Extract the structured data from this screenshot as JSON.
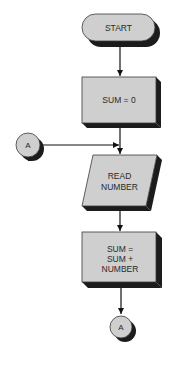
{
  "diagram": {
    "type": "flowchart",
    "colors": {
      "fill": "#cfcfcf",
      "shadow": "#1c1c1c",
      "stroke": "#3a3a3a",
      "line": "#111111",
      "background": "#ffffff"
    },
    "nodes": {
      "start": {
        "shape": "terminal",
        "label": "START"
      },
      "init": {
        "shape": "process",
        "label": "SUM = 0"
      },
      "connector_in": {
        "shape": "connector",
        "label": "A"
      },
      "read": {
        "shape": "input-output",
        "lines": [
          "READ",
          "NUMBER"
        ]
      },
      "add": {
        "shape": "process",
        "lines": [
          "SUM =",
          "SUM +",
          "NUMBER"
        ]
      },
      "connector_out": {
        "shape": "connector",
        "label": "A"
      }
    },
    "edges": [
      {
        "from": "start",
        "to": "init"
      },
      {
        "from": "init",
        "to": "read"
      },
      {
        "from": "connector_in",
        "to": "read"
      },
      {
        "from": "read",
        "to": "add"
      },
      {
        "from": "add",
        "to": "connector_out"
      }
    ]
  }
}
